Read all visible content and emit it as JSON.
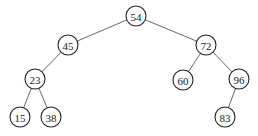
{
  "diagram": {
    "type": "binary-search-tree",
    "node_radius": 10,
    "colors": {
      "background": "#ffffff",
      "node_stroke": "#222222",
      "edge_stroke": "#555555",
      "text": "#222222"
    },
    "nodes": [
      {
        "id": "n54",
        "label": "54",
        "x": 136,
        "y": 16
      },
      {
        "id": "n45",
        "label": "45",
        "x": 68,
        "y": 45
      },
      {
        "id": "n72",
        "label": "72",
        "x": 206,
        "y": 45
      },
      {
        "id": "n23",
        "label": "23",
        "x": 35,
        "y": 79
      },
      {
        "id": "n60",
        "label": "60",
        "x": 183,
        "y": 80
      },
      {
        "id": "n96",
        "label": "96",
        "x": 239,
        "y": 79
      },
      {
        "id": "n15",
        "label": "15",
        "x": 20,
        "y": 117
      },
      {
        "id": "n38",
        "label": "38",
        "x": 51,
        "y": 117
      },
      {
        "id": "n83",
        "label": "83",
        "x": 225,
        "y": 117
      }
    ],
    "edges": [
      {
        "from": "n54",
        "to": "n45"
      },
      {
        "from": "n54",
        "to": "n72"
      },
      {
        "from": "n45",
        "to": "n23"
      },
      {
        "from": "n72",
        "to": "n60"
      },
      {
        "from": "n72",
        "to": "n96"
      },
      {
        "from": "n23",
        "to": "n15"
      },
      {
        "from": "n23",
        "to": "n38"
      },
      {
        "from": "n96",
        "to": "n83"
      }
    ]
  }
}
